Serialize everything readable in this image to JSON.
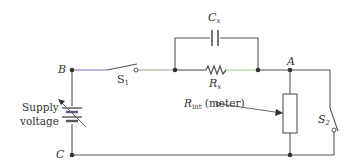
{
  "diagram": {
    "title": "",
    "nodes": {
      "B": "B",
      "C": "C",
      "A": "A"
    },
    "labels": {
      "switch1_main": "S",
      "switch1_sub": "1",
      "switch2_main": "S",
      "switch2_sub": "2",
      "capacitor_main": "C",
      "capacitor_sub": "x",
      "resistor_main": "R",
      "resistor_sub": "x",
      "meter_main": "R",
      "meter_sub": "int",
      "meter_suffix": " (meter)",
      "supply_line1": "Supply",
      "supply_line2": "voltage"
    },
    "components": [
      {
        "id": "supply",
        "type": "variable-battery",
        "label": "Supply voltage"
      },
      {
        "id": "S1",
        "type": "switch",
        "label": "S1",
        "state": "open"
      },
      {
        "id": "Cx",
        "type": "capacitor",
        "label": "Cx"
      },
      {
        "id": "Rx",
        "type": "resistor",
        "label": "Rx"
      },
      {
        "id": "Rint",
        "type": "resistor",
        "label": "Rint (meter)"
      },
      {
        "id": "S2",
        "type": "switch",
        "label": "S2",
        "state": "open"
      }
    ],
    "colors": {
      "wire": "#555555",
      "wire_accent_purple": "#7a6fc0",
      "wire_accent_green": "#9ccf8a",
      "text": "#333333"
    }
  }
}
